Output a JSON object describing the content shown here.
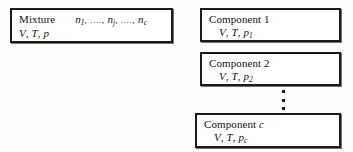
{
  "figure": {
    "mixture": {
      "label": "Mixture",
      "amounts_prefix": "n",
      "amounts": "n1 , ...., nj , ...., nc",
      "amount_first_sub": "1",
      "amount_mid_sub": "j",
      "amount_last_sub": "c",
      "separator": ", ...., ",
      "state_volume": "V",
      "state_temperature": "T",
      "state_pressure": "p",
      "comma": ",",
      "state_line": "V, T, p"
    },
    "components": [
      {
        "name": "Component 1",
        "title_word": "Component",
        "index": "1",
        "state_volume": "V",
        "state_temperature": "T",
        "pressure_symbol": "p",
        "pressure_sub": "1",
        "state_line": "V, T, p1"
      },
      {
        "name": "Component 2",
        "title_word": "Component",
        "index": "2",
        "state_volume": "V",
        "state_temperature": "T",
        "pressure_symbol": "p",
        "pressure_sub": "2",
        "state_line": "V, T, p2"
      },
      {
        "name": "Component c",
        "title_word": "Component",
        "index": "c",
        "state_volume": "V",
        "state_temperature": "T",
        "pressure_symbol": "p",
        "pressure_sub": "c",
        "state_line": "V, T, pc"
      }
    ],
    "ellipsis": {
      "name": "vertical-ellipsis",
      "dot_count": 3
    },
    "colors": {
      "background": "#fdfdfb",
      "box_fill": "#ffffff",
      "border": "#1a1a1a",
      "text": "#111111"
    }
  }
}
